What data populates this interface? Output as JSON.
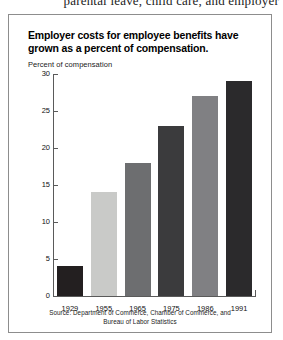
{
  "page": {
    "top_cut_text": "parental leave, child care, and employer"
  },
  "figure": {
    "title_line1": "Employer costs for employee benefits have",
    "title_line2": "grown as a percent of compensation.",
    "source_line1": "Source: Department of Commerce, Chamber of Commerce, and",
    "source_line2": "Bureau of Labor Statistics"
  },
  "chart_data": {
    "type": "bar",
    "title": "Employer costs for employee benefits have grown as a percent of compensation.",
    "subtitle": "",
    "categories": [
      "1929",
      "1955",
      "1965",
      "1975",
      "1986",
      "1991"
    ],
    "values": [
      4,
      14,
      18,
      23,
      27,
      29
    ],
    "bar_colors": [
      "#231f20",
      "#c9cac8",
      "#6d6e70",
      "#3b3b3d",
      "#808083",
      "#2b2a2c"
    ],
    "xlabel": "",
    "ylabel": "Percent of compensation",
    "ylim": [
      0,
      30
    ],
    "yticks": [
      0,
      5,
      10,
      15,
      20,
      25,
      30
    ],
    "ytick_labels": [
      "0",
      "5",
      "10",
      "15",
      "20",
      "25",
      "30"
    ],
    "grid": false,
    "legend": "none"
  }
}
